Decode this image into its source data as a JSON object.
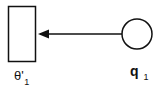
{
  "diagram": {
    "nodes": [
      {
        "id": "theta",
        "shape": "rectangle",
        "label": "θ'",
        "subscript": "1"
      },
      {
        "id": "q",
        "shape": "circle",
        "label": "q",
        "subscript": "1"
      }
    ],
    "edges": [
      {
        "from": "q",
        "to": "theta",
        "style": "solid-arrow"
      }
    ],
    "colors": {
      "stroke": "#111111",
      "background": "#ffffff"
    }
  }
}
